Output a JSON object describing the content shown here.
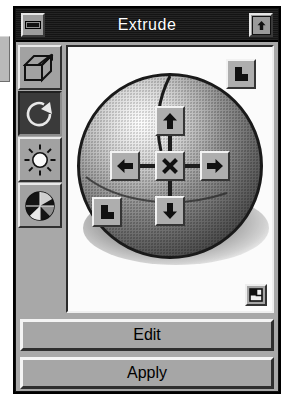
{
  "window": {
    "title": "Extrude",
    "close_button": "close-box",
    "zoom_button": "zoom-box"
  },
  "palette": {
    "tools": [
      {
        "name": "extrude",
        "icon": "extrude-box-icon",
        "selected": false
      },
      {
        "name": "rotate",
        "icon": "rotate-icon",
        "selected": true
      },
      {
        "name": "light",
        "icon": "sun-light-icon",
        "selected": false
      },
      {
        "name": "shading",
        "icon": "sphere-shading-icon",
        "selected": false
      }
    ]
  },
  "canvas": {
    "object": "sphere",
    "controls": [
      {
        "name": "move-up",
        "icon": "arrow-up-icon"
      },
      {
        "name": "move-down",
        "icon": "arrow-down-icon"
      },
      {
        "name": "move-left",
        "icon": "arrow-left-icon"
      },
      {
        "name": "move-right",
        "icon": "arrow-right-icon"
      },
      {
        "name": "reset-center",
        "icon": "cross-x-icon"
      },
      {
        "name": "move-northeast",
        "icon": "arrow-diagonal-icon"
      },
      {
        "name": "move-southwest",
        "icon": "arrow-diagonal-icon"
      }
    ],
    "corner_widget": "page-icon"
  },
  "actions": {
    "edit_label": "Edit",
    "apply_label": "Apply"
  },
  "colors": {
    "window_face": "#a8a8a8",
    "titlebar": "#141414",
    "title_text": "#ffffff",
    "canvas_bg": "#fbfbfb",
    "selected_tool_bg": "#3a3a3a"
  }
}
